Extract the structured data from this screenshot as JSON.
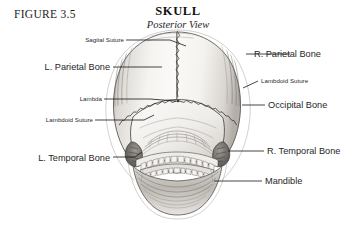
{
  "figure": {
    "number_label": "FIGURE 3.5",
    "title": "SKULL",
    "subtitle": "Posterior View"
  },
  "colors": {
    "background": "#ffffff",
    "ink": "#1a1a1a",
    "leader": "#161616",
    "bone_outline": "#4a4745",
    "bone_fill_light": "#fbfaf8",
    "bone_fill_mid": "#e6e3df",
    "bone_shadow": "#b9b5b0",
    "suture": "#3b3936"
  },
  "labels": {
    "left": [
      {
        "id": "sagital-suture",
        "text": "Sagital Suture",
        "size": "small"
      },
      {
        "id": "left-parietal-bone",
        "text": "L. Parietal Bone",
        "size": "large"
      },
      {
        "id": "lambda",
        "text": "Lambda",
        "size": "small"
      },
      {
        "id": "lambdoid-suture-left",
        "text": "Lambdoid Suture",
        "size": "small"
      },
      {
        "id": "left-temporal-bone",
        "text": "L. Temporal Bone",
        "size": "large"
      }
    ],
    "right": [
      {
        "id": "right-parietal-bone",
        "text": "R. Parietal Bone",
        "size": "large"
      },
      {
        "id": "lambdoid-suture-right",
        "text": "Lambdoid Suture",
        "size": "small"
      },
      {
        "id": "occipital-bone",
        "text": "Occipital Bone",
        "size": "large"
      },
      {
        "id": "right-temporal-bone",
        "text": "R. Temporal Bone",
        "size": "large"
      },
      {
        "id": "mandible",
        "text": "Mandible",
        "size": "large"
      }
    ]
  },
  "illustration": {
    "name": "human-skull-posterior-view",
    "description": "Grayscale pencil-style anatomical drawing of a human skull seen from behind, showing cranial vault, sutures, mastoid processes, teeth and mandible"
  }
}
